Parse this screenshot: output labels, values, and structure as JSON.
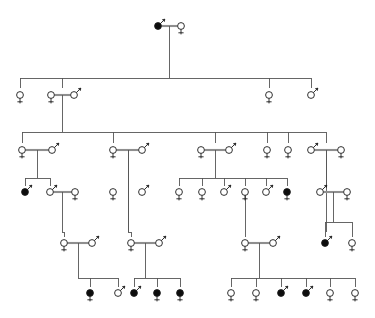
{
  "document": {
    "title": "Pedigree Chart",
    "type": "genealogical-pedigree-diagram",
    "width": 375,
    "height": 318,
    "background_color": "#ffffff",
    "line_color": "#555555",
    "symbol_outline_color": "#1a1a1a",
    "affected_fill_color": "#0d0d0d",
    "unaffected_fill_color": "#ffffff",
    "mate_band_color": "#bdbdbd",
    "legend_note": "Circle with downward cross = female; circle with upward-right arrow = male; filled symbol = affected; open symbol = unaffected",
    "generation_count": 6,
    "individual_count": 61,
    "affected_count": 14
  },
  "symbol_geometry": {
    "radius": 3.4,
    "female_stem_length": 7,
    "female_bar_halfwidth": 2.6,
    "female_bar_offset": 4.8,
    "male_arrow_length": 7,
    "male_arrow_head": 2.6
  },
  "generations": [
    {
      "id": "I",
      "label": "I",
      "y": 26,
      "member_count": 2
    },
    {
      "id": "II",
      "label": "II",
      "y": 95,
      "member_count": 5
    },
    {
      "id": "III",
      "label": "III",
      "y": 150,
      "member_count": 12
    },
    {
      "id": "IV",
      "label": "IV",
      "y": 192,
      "member_count": 16
    },
    {
      "id": "V",
      "label": "V",
      "y": 243,
      "member_count": 11
    },
    {
      "id": "VI",
      "label": "VI",
      "y": 293,
      "member_count": 15
    }
  ],
  "individuals": [
    {
      "id": "I-1",
      "gen": "I",
      "sex": "male",
      "affected": true,
      "x": 158,
      "y": 26
    },
    {
      "id": "I-2",
      "gen": "I",
      "sex": "female",
      "affected": false,
      "x": 181,
      "y": 26
    },
    {
      "id": "II-1",
      "gen": "II",
      "sex": "female",
      "affected": false,
      "x": 20,
      "y": 95
    },
    {
      "id": "II-2",
      "gen": "II",
      "sex": "female",
      "affected": false,
      "x": 51,
      "y": 95
    },
    {
      "id": "II-3",
      "gen": "II",
      "sex": "male",
      "affected": false,
      "x": 74,
      "y": 95
    },
    {
      "id": "II-4",
      "gen": "II",
      "sex": "female",
      "affected": false,
      "x": 269,
      "y": 95
    },
    {
      "id": "II-5",
      "gen": "II",
      "sex": "male",
      "affected": false,
      "x": 311,
      "y": 95
    },
    {
      "id": "III-1",
      "gen": "III",
      "sex": "female",
      "affected": false,
      "x": 22,
      "y": 150
    },
    {
      "id": "III-2",
      "gen": "III",
      "sex": "male",
      "affected": false,
      "x": 52,
      "y": 150
    },
    {
      "id": "III-3",
      "gen": "III",
      "sex": "female",
      "affected": false,
      "x": 113,
      "y": 150
    },
    {
      "id": "III-4",
      "gen": "III",
      "sex": "male",
      "affected": false,
      "x": 142,
      "y": 150
    },
    {
      "id": "III-5",
      "gen": "III",
      "sex": "female",
      "affected": false,
      "x": 201,
      "y": 150
    },
    {
      "id": "III-6",
      "gen": "III",
      "sex": "male",
      "affected": false,
      "x": 229,
      "y": 150
    },
    {
      "id": "III-7",
      "gen": "III",
      "sex": "female",
      "affected": false,
      "x": 267,
      "y": 150
    },
    {
      "id": "III-8",
      "gen": "III",
      "sex": "female",
      "affected": false,
      "x": 288,
      "y": 150
    },
    {
      "id": "III-9",
      "gen": "III",
      "sex": "male",
      "affected": false,
      "x": 311,
      "y": 150
    },
    {
      "id": "III-10",
      "gen": "III",
      "sex": "female",
      "affected": false,
      "x": 341,
      "y": 150
    },
    {
      "id": "IV-1",
      "gen": "IV",
      "sex": "male",
      "affected": true,
      "x": 25,
      "y": 192
    },
    {
      "id": "IV-2",
      "gen": "IV",
      "sex": "male",
      "affected": false,
      "x": 50,
      "y": 192
    },
    {
      "id": "IV-3",
      "gen": "IV",
      "sex": "female",
      "affected": false,
      "x": 75,
      "y": 192
    },
    {
      "id": "IV-4",
      "gen": "IV",
      "sex": "female",
      "affected": false,
      "x": 113,
      "y": 192
    },
    {
      "id": "IV-5",
      "gen": "IV",
      "sex": "male",
      "affected": false,
      "x": 142,
      "y": 192
    },
    {
      "id": "IV-6",
      "gen": "IV",
      "sex": "female",
      "affected": false,
      "x": 179,
      "y": 192
    },
    {
      "id": "IV-7",
      "gen": "IV",
      "sex": "female",
      "affected": false,
      "x": 202,
      "y": 192
    },
    {
      "id": "IV-8",
      "gen": "IV",
      "sex": "male",
      "affected": false,
      "x": 224,
      "y": 192
    },
    {
      "id": "IV-9",
      "gen": "IV",
      "sex": "female",
      "affected": false,
      "x": 245,
      "y": 192
    },
    {
      "id": "IV-10",
      "gen": "IV",
      "sex": "male",
      "affected": false,
      "x": 266,
      "y": 192
    },
    {
      "id": "IV-11",
      "gen": "IV",
      "sex": "female",
      "affected": true,
      "x": 287,
      "y": 192
    },
    {
      "id": "IV-12",
      "gen": "IV",
      "sex": "male",
      "affected": false,
      "x": 320,
      "y": 192
    },
    {
      "id": "IV-13",
      "gen": "IV",
      "sex": "female",
      "affected": false,
      "x": 347,
      "y": 192
    },
    {
      "id": "V-1",
      "gen": "V",
      "sex": "female",
      "affected": false,
      "x": 64,
      "y": 243
    },
    {
      "id": "V-2",
      "gen": "V",
      "sex": "male",
      "affected": false,
      "x": 92,
      "y": 243
    },
    {
      "id": "V-3",
      "gen": "V",
      "sex": "female",
      "affected": false,
      "x": 131,
      "y": 243
    },
    {
      "id": "V-4",
      "gen": "V",
      "sex": "male",
      "affected": false,
      "x": 159,
      "y": 243
    },
    {
      "id": "V-5",
      "gen": "V",
      "sex": "female",
      "affected": false,
      "x": 245,
      "y": 243
    },
    {
      "id": "V-6",
      "gen": "V",
      "sex": "male",
      "affected": false,
      "x": 273,
      "y": 243
    },
    {
      "id": "V-7",
      "gen": "V",
      "sex": "male",
      "affected": true,
      "x": 325,
      "y": 243
    },
    {
      "id": "V-8",
      "gen": "V",
      "sex": "female",
      "affected": false,
      "x": 352,
      "y": 243
    },
    {
      "id": "VI-1",
      "gen": "VI",
      "sex": "female",
      "affected": true,
      "x": 90,
      "y": 293
    },
    {
      "id": "VI-2",
      "gen": "VI",
      "sex": "male",
      "affected": false,
      "x": 118,
      "y": 293
    },
    {
      "id": "VI-3",
      "gen": "VI",
      "sex": "male",
      "affected": true,
      "x": 134,
      "y": 293
    },
    {
      "id": "VI-4",
      "gen": "VI",
      "sex": "female",
      "affected": true,
      "x": 157,
      "y": 293
    },
    {
      "id": "VI-5",
      "gen": "VI",
      "sex": "female",
      "affected": true,
      "x": 180,
      "y": 293
    },
    {
      "id": "VI-6",
      "gen": "VI",
      "sex": "female",
      "affected": false,
      "x": 231,
      "y": 293
    },
    {
      "id": "VI-7",
      "gen": "VI",
      "sex": "female",
      "affected": false,
      "x": 256,
      "y": 293
    },
    {
      "id": "VI-8",
      "gen": "VI",
      "sex": "male",
      "affected": true,
      "x": 281,
      "y": 293
    },
    {
      "id": "VI-9",
      "gen": "VI",
      "sex": "male",
      "affected": true,
      "x": 306,
      "y": 293
    },
    {
      "id": "VI-10",
      "gen": "VI",
      "sex": "female",
      "affected": false,
      "x": 330,
      "y": 293
    },
    {
      "id": "VI-11",
      "gen": "VI",
      "sex": "female",
      "affected": false,
      "x": 355,
      "y": 293
    }
  ],
  "unions": [
    {
      "id": "U1",
      "left_x": 158,
      "right_x": 181,
      "y": 26,
      "drop_x": 169,
      "drop_to_y": 78
    },
    {
      "id": "U2",
      "left_x": 51,
      "right_x": 74,
      "y": 95,
      "drop_x": 62,
      "drop_to_y": 132
    },
    {
      "id": "U3",
      "left_x": 22,
      "right_x": 52,
      "y": 150,
      "drop_x": 37,
      "drop_to_y": 178
    },
    {
      "id": "U4",
      "left_x": 113,
      "right_x": 142,
      "y": 150,
      "drop_x": 128,
      "drop_to_y": 232
    },
    {
      "id": "U5",
      "left_x": 201,
      "right_x": 229,
      "y": 150,
      "drop_x": 215,
      "drop_to_y": 178
    },
    {
      "id": "U6",
      "left_x": 311,
      "right_x": 341,
      "y": 150,
      "drop_x": 326,
      "drop_to_y": 232
    },
    {
      "id": "U7",
      "left_x": 50,
      "right_x": 75,
      "y": 192,
      "drop_x": 62,
      "drop_to_y": 232
    },
    {
      "id": "U8",
      "left_x": 320,
      "right_x": 347,
      "y": 192,
      "drop_x": 333,
      "drop_to_y": 222
    },
    {
      "id": "U9",
      "left_x": 64,
      "right_x": 92,
      "y": 243,
      "drop_x": 78,
      "drop_to_y": 278
    },
    {
      "id": "U10",
      "left_x": 131,
      "right_x": 159,
      "y": 243,
      "drop_x": 145,
      "drop_to_y": 278
    },
    {
      "id": "U11",
      "left_x": 245,
      "right_x": 273,
      "y": 243,
      "drop_x": 259,
      "drop_to_y": 278
    }
  ],
  "sibships": [
    {
      "id": "S1",
      "parent_union": "U1",
      "parent_drop_x": 169,
      "bus_y": 78,
      "child_top_y": 88,
      "children_x": [
        20,
        62,
        269,
        311
      ]
    },
    {
      "id": "S2",
      "parent_union": "U2",
      "parent_drop_x": 62,
      "bus_y": 132,
      "child_top_y": 143,
      "children_x": [
        22,
        113,
        215,
        267,
        288,
        326
      ]
    },
    {
      "id": "S3",
      "parent_union": "U3",
      "parent_drop_x": 37,
      "bus_y": 178,
      "child_top_y": 186,
      "children_x": [
        25,
        50
      ]
    },
    {
      "id": "S4",
      "parent_union": "U5",
      "parent_drop_x": 215,
      "bus_y": 178,
      "child_top_y": 186,
      "children_x": [
        179,
        202,
        224,
        245,
        266,
        287
      ]
    },
    {
      "id": "S5",
      "parent_union": "U7",
      "parent_drop_x": 62,
      "bus_y": 232,
      "child_top_y": 237,
      "children_x": [
        64
      ]
    },
    {
      "id": "S6",
      "parent_union": "U4",
      "parent_drop_x": 128,
      "bus_y": 232,
      "child_top_y": 237,
      "children_x": [
        131
      ]
    },
    {
      "id": "S7",
      "parent_union": "IV-9",
      "parent_drop_x": 245,
      "bus_y": 232,
      "child_top_y": 237,
      "children_x": [
        245
      ]
    },
    {
      "id": "S8",
      "parent_union": "U8",
      "parent_drop_x": 333,
      "bus_y": 222,
      "child_top_y": 237,
      "children_x": [
        325,
        352
      ]
    },
    {
      "id": "S9",
      "parent_union": "U9",
      "parent_drop_x": 78,
      "bus_y": 278,
      "child_top_y": 287,
      "children_x": [
        90,
        118
      ]
    },
    {
      "id": "S10",
      "parent_union": "U10",
      "parent_drop_x": 145,
      "bus_y": 278,
      "child_top_y": 287,
      "children_x": [
        134,
        157,
        180
      ]
    },
    {
      "id": "S11",
      "parent_union": "U11",
      "parent_drop_x": 259,
      "bus_y": 278,
      "child_top_y": 287,
      "children_x": [
        231,
        256,
        281,
        306,
        330,
        355
      ]
    }
  ]
}
